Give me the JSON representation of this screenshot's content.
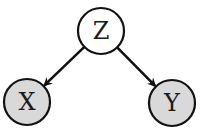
{
  "diagram": {
    "type": "directed-graph",
    "nodes": [
      {
        "id": "Z",
        "label": "Z",
        "observed": false,
        "fill": "#ffffff"
      },
      {
        "id": "X",
        "label": "X",
        "observed": true,
        "fill": "#d9d9d9"
      },
      {
        "id": "Y",
        "label": "Y",
        "observed": true,
        "fill": "#d9d9d9"
      }
    ],
    "edges": [
      {
        "from": "Z",
        "to": "X"
      },
      {
        "from": "Z",
        "to": "Y"
      }
    ],
    "stroke_color": "#111111"
  }
}
